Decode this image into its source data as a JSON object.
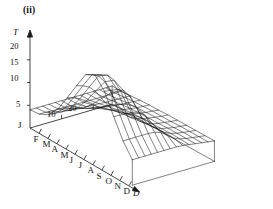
{
  "figure": {
    "panel_label": "(ii)",
    "background_color": "#ffffff",
    "line_color": "#1a1a1a"
  },
  "axes": {
    "vertical": {
      "name": "T",
      "name_style": "italic",
      "ticks": [
        "20",
        "15",
        "10",
        "5"
      ],
      "tick_values": [
        20,
        15,
        10,
        5
      ],
      "origin_label": "J",
      "range": [
        0,
        22
      ]
    },
    "depth": {
      "name": "D",
      "name_style": "italic",
      "ticks": [
        "10",
        "20"
      ],
      "tick_values": [
        10,
        20
      ],
      "range": [
        0,
        26
      ]
    },
    "month": {
      "labels": [
        "J",
        "F",
        "M",
        "A",
        "M",
        "J",
        "J",
        "A",
        "S",
        "O",
        "N",
        "D"
      ],
      "arrow": true
    }
  },
  "chart_data": {
    "type": "line",
    "title": "(ii)",
    "xlabel": "",
    "ylabel": "T",
    "zlabel": "D",
    "projection": "3d-wireframe-surface",
    "grid": true,
    "legend": false,
    "x": [
      "J",
      "F",
      "M",
      "A",
      "M",
      "J",
      "J",
      "A",
      "S",
      "O",
      "N",
      "D"
    ],
    "depths": [
      0,
      2,
      4,
      6,
      8,
      10,
      12,
      14,
      16,
      18,
      20,
      22,
      24,
      26
    ],
    "ylim": [
      0,
      22
    ],
    "zlim": [
      0,
      26
    ],
    "series": [
      {
        "name": "D=0",
        "values": [
          4.0,
          4.2,
          5.2,
          7.6,
          11.2,
          15.0,
          18.6,
          19.6,
          17.2,
          12.8,
          8.6,
          5.6
        ]
      },
      {
        "name": "D=2",
        "values": [
          4.0,
          4.2,
          5.1,
          7.3,
          10.8,
          14.6,
          18.2,
          19.3,
          17.0,
          12.7,
          8.6,
          5.6
        ]
      },
      {
        "name": "D=4",
        "values": [
          4.0,
          4.1,
          5.0,
          7.0,
          10.2,
          13.9,
          17.5,
          18.8,
          16.8,
          12.6,
          8.6,
          5.6
        ]
      },
      {
        "name": "D=6",
        "values": [
          4.0,
          4.1,
          4.9,
          6.6,
          9.3,
          12.6,
          15.8,
          17.3,
          16.2,
          12.5,
          8.6,
          5.6
        ]
      },
      {
        "name": "D=8",
        "values": [
          4.0,
          4.1,
          4.8,
          6.1,
          8.2,
          10.6,
          13.0,
          14.6,
          14.6,
          12.2,
          8.6,
          5.6
        ]
      },
      {
        "name": "D=10",
        "values": [
          4.0,
          4.0,
          4.7,
          5.7,
          7.1,
          8.6,
          10.0,
          11.2,
          11.8,
          11.0,
          8.5,
          5.6
        ]
      },
      {
        "name": "D=12",
        "values": [
          4.0,
          4.0,
          4.6,
          5.4,
          6.3,
          7.1,
          7.8,
          8.4,
          8.9,
          9.0,
          8.0,
          5.6
        ]
      },
      {
        "name": "D=14",
        "values": [
          4.0,
          4.0,
          4.5,
          5.1,
          5.7,
          6.2,
          6.4,
          6.7,
          7.0,
          7.2,
          7.0,
          5.6
        ]
      },
      {
        "name": "D=16",
        "values": [
          4.0,
          4.0,
          4.4,
          4.9,
          5.3,
          5.6,
          5.7,
          5.8,
          6.0,
          6.1,
          6.0,
          5.5
        ]
      },
      {
        "name": "D=18",
        "values": [
          4.0,
          4.0,
          4.3,
          4.7,
          5.0,
          5.2,
          5.3,
          5.3,
          5.4,
          5.5,
          5.4,
          5.3
        ]
      },
      {
        "name": "D=20",
        "values": [
          4.0,
          4.0,
          4.3,
          4.6,
          4.8,
          4.9,
          5.0,
          5.0,
          5.1,
          5.1,
          5.1,
          5.1
        ]
      },
      {
        "name": "D=22",
        "values": [
          4.0,
          4.0,
          4.2,
          4.5,
          4.6,
          4.7,
          4.8,
          4.8,
          4.8,
          4.9,
          4.9,
          4.9
        ]
      },
      {
        "name": "D=24",
        "values": [
          4.0,
          4.0,
          4.2,
          4.4,
          4.5,
          4.6,
          4.6,
          4.6,
          4.7,
          4.7,
          4.7,
          4.7
        ]
      },
      {
        "name": "D=26",
        "values": [
          4.0,
          4.0,
          4.1,
          4.3,
          4.4,
          4.4,
          4.5,
          4.5,
          4.5,
          4.5,
          4.5,
          4.5
        ]
      }
    ]
  },
  "geometry": {
    "origin": [
      30,
      128
    ],
    "month_step": [
      9.3,
      5.2
    ],
    "depth_step": [
      8.1,
      -2.35
    ],
    "temp_unit_per_px": 4.0,
    "month_axis_end": [
      136,
      190
    ],
    "depth_tick_px": [
      10,
      20
    ]
  }
}
